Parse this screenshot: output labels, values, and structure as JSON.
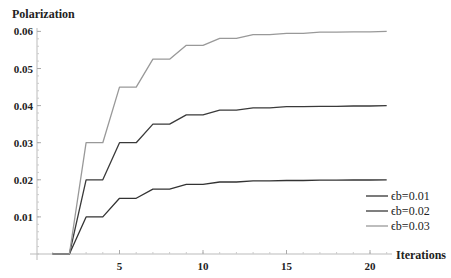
{
  "chart_data": {
    "type": "line",
    "title": "",
    "xlabel": "Iterations",
    "ylabel": "Polarization",
    "xlim": [
      0,
      21
    ],
    "ylim": [
      0,
      0.06
    ],
    "x_ticks": [
      5,
      10,
      15,
      20
    ],
    "x_tick_labels": [
      "5",
      "10",
      "15",
      "20"
    ],
    "y_ticks": [
      0.01,
      0.02,
      0.03,
      0.04,
      0.05,
      0.06
    ],
    "y_tick_labels": [
      "0.01",
      "0.02",
      "0.03",
      "0.04",
      "0.05",
      "0.06"
    ],
    "grid": false,
    "legend_position": "lower right",
    "x": [
      1,
      2,
      3,
      4,
      5,
      6,
      7,
      8,
      9,
      10,
      11,
      12,
      13,
      14,
      15,
      16,
      17,
      18,
      19,
      20,
      21
    ],
    "series": [
      {
        "name": "ϵb=0.01",
        "color": "#333333",
        "values": [
          0,
          0,
          0.01,
          0.01,
          0.015,
          0.015,
          0.0175,
          0.0175,
          0.01875,
          0.01875,
          0.0194,
          0.0194,
          0.0197,
          0.0197,
          0.0198,
          0.0198,
          0.0199,
          0.0199,
          0.01995,
          0.01995,
          0.02
        ]
      },
      {
        "name": "ϵb=0.02",
        "color": "#3a3a3a",
        "values": [
          0,
          0,
          0.02,
          0.02,
          0.03,
          0.03,
          0.035,
          0.035,
          0.0375,
          0.0375,
          0.0388,
          0.0388,
          0.0394,
          0.0394,
          0.0397,
          0.0397,
          0.0398,
          0.0398,
          0.0399,
          0.0399,
          0.04
        ]
      },
      {
        "name": "ϵb=0.03",
        "color": "#999999",
        "values": [
          0,
          0,
          0.03,
          0.03,
          0.045,
          0.045,
          0.0525,
          0.0525,
          0.05625,
          0.05625,
          0.0581,
          0.0581,
          0.0591,
          0.0591,
          0.0595,
          0.0595,
          0.0598,
          0.0598,
          0.0599,
          0.0599,
          0.06
        ]
      }
    ]
  },
  "axis": {
    "ylabel": "Polarization",
    "xlabel": "Iterations"
  },
  "legend": {
    "items": [
      "ϵb=0.01",
      "ϵb=0.02",
      "ϵb=0.03"
    ]
  }
}
